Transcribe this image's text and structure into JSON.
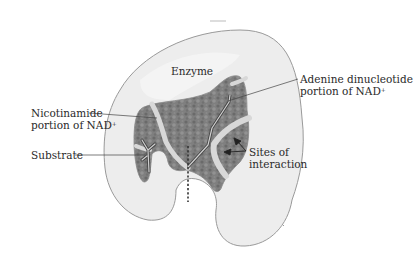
{
  "diagram": {
    "type": "enzyme-binding-site-illustration",
    "labels": {
      "enzyme": "Enzyme",
      "adenine_line1": "Adenine dinucleotide",
      "adenine_line2": "portion of NAD",
      "adenine_sup": "+",
      "nicotinamide_line1": "Nicotinamide",
      "nicotinamide_line2": "portion of NAD",
      "nicotinamide_sup": "+",
      "substrate": "Substrate",
      "sites_line1": "Sites of",
      "sites_line2": "interaction"
    },
    "colors": {
      "enzyme_fill": "#ececec",
      "enzyme_outline": "#9a9a9a",
      "binding_pocket": "#7d7d7d",
      "groove": "#d6d6d6",
      "text": "#2a2a2a",
      "leader_line": "#444444"
    }
  }
}
